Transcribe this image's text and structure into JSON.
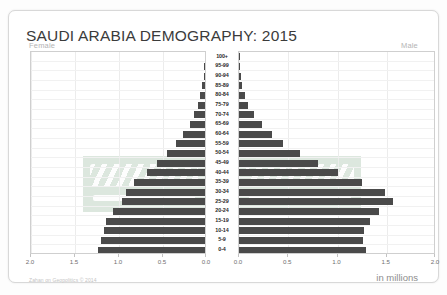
{
  "header": {
    "title": "SAUDI ARABIA DEMOGRAPHY: 2015",
    "left_side_label": "Female",
    "right_side_label": "Male"
  },
  "footer": {
    "credit": "Zahan on Geopolitics © 2014",
    "units": "in millions"
  },
  "colors": {
    "bar": "#4a4a4a",
    "frame": "#cfcfcf",
    "grid": "#ececec",
    "title": "#3b3b3b",
    "flag_green": "#2f6d3a"
  },
  "chart_data": {
    "type": "bar",
    "subtype": "population-pyramid",
    "title": "SAUDI ARABIA DEMOGRAPHY: 2015",
    "xlabel": "in millions",
    "ylabel": "",
    "xlim": [
      0,
      2.0
    ],
    "female_xticks": [
      "2.0",
      "1.5",
      "1.0",
      "0.5",
      "0.0"
    ],
    "male_xticks": [
      "0.0",
      "0.5",
      "1.0",
      "1.5",
      "2.0"
    ],
    "tick_values": [
      2.0,
      1.5,
      1.0,
      0.5,
      0.0
    ],
    "grid": true,
    "legend": "none",
    "categories": [
      "100+",
      "95-99",
      "90-94",
      "85-89",
      "80-84",
      "75-79",
      "70-74",
      "65-69",
      "60-64",
      "55-59",
      "50-54",
      "45-49",
      "40-44",
      "35-39",
      "30-34",
      "25-29",
      "20-24",
      "15-19",
      "10-14",
      "5-9",
      "0-4"
    ],
    "series": [
      {
        "name": "Female",
        "side": "left",
        "values": [
          0.002,
          0.006,
          0.014,
          0.03,
          0.055,
          0.08,
          0.12,
          0.175,
          0.25,
          0.33,
          0.43,
          0.54,
          0.66,
          0.81,
          0.9,
          0.94,
          1.05,
          1.12,
          1.15,
          1.18,
          1.22
        ]
      },
      {
        "name": "Male",
        "side": "right",
        "values": [
          0.002,
          0.006,
          0.016,
          0.035,
          0.065,
          0.095,
          0.15,
          0.23,
          0.33,
          0.45,
          0.62,
          0.8,
          1.01,
          1.25,
          1.48,
          1.56,
          1.42,
          1.33,
          1.27,
          1.26,
          1.29
        ]
      }
    ]
  }
}
